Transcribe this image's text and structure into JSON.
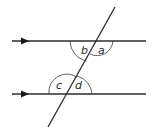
{
  "diagram": {
    "type": "parallel-lines-transversal",
    "parallel_lines": [
      {
        "id": "top-line",
        "y": 41,
        "x1": 12,
        "x2": 146,
        "arrow_x": 25
      },
      {
        "id": "bottom-line",
        "y": 94,
        "x1": 12,
        "x2": 146,
        "arrow_x": 25
      }
    ],
    "transversal": {
      "x1": 115,
      "y1": 7,
      "x2": 48,
      "y2": 127
    },
    "angles": {
      "a": {
        "label": "a",
        "position": "top intersection, below line, right of transversal"
      },
      "b": {
        "label": "b",
        "position": "top intersection, below line, left of transversal"
      },
      "c": {
        "label": "c",
        "position": "bottom intersection, above line, left of transversal"
      },
      "d": {
        "label": "d",
        "position": "bottom intersection, above line, right of transversal"
      }
    },
    "colors": {
      "stroke": "#2b2b2b",
      "background": "#ffffff"
    }
  }
}
